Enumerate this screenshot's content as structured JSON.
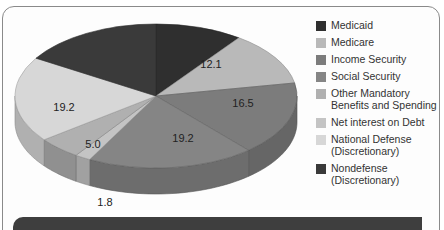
{
  "chart_data": {
    "type": "pie",
    "style": "3d",
    "title": "",
    "slices": [
      {
        "name": "Medicaid",
        "value": 10.0,
        "label": "",
        "color": "#2f2f2f"
      },
      {
        "name": "Medicare",
        "value": 12.1,
        "label": "12.1",
        "color": "#b9b9b9"
      },
      {
        "name": "Income Security",
        "value": 16.5,
        "label": "16.5",
        "color": "#7c7c7c"
      },
      {
        "name": "Social Security",
        "value": 19.2,
        "label": "19.2",
        "color": "#858585"
      },
      {
        "name": "Net interest on Debt",
        "value": 1.8,
        "label": "1.8",
        "color": "#c4c4c4"
      },
      {
        "name": "Other Mandatory Benefits and Spending",
        "value": 5.0,
        "label": "5.0",
        "color": "#b0b0b0"
      },
      {
        "name": "National Defense (Discretionary)",
        "value": 19.2,
        "label": "19.2",
        "color": "#d7d7d7"
      },
      {
        "name": "Nondefense (Discretionary)",
        "value": 16.2,
        "label": "",
        "color": "#3a3a3a"
      }
    ],
    "legend_position": "right"
  },
  "legend": {
    "items": [
      {
        "label": "Medicaid",
        "color": "#2f2f2f"
      },
      {
        "label": "Medicare",
        "color": "#b9b9b9"
      },
      {
        "label": "Income Security",
        "color": "#7c7c7c"
      },
      {
        "label": "Social Security",
        "color": "#858585"
      },
      {
        "label": "Other Mandatory Benefits and Spending",
        "color": "#b0b0b0"
      },
      {
        "label": "Net interest on Debt",
        "color": "#c4c4c4"
      },
      {
        "label": "National Defense (Discretionary)",
        "color": "#d7d7d7"
      },
      {
        "label": "Nondefense (Discretionary)",
        "color": "#3a3a3a"
      }
    ]
  },
  "labels": {
    "medicare": "12.1",
    "income_security": "16.5",
    "social_security": "19.2",
    "national_defense": "19.2",
    "other_mandatory": "5.0",
    "net_interest": "1.8"
  }
}
